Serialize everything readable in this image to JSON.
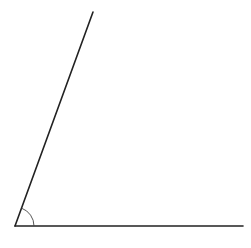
{
  "diagram": {
    "type": "angle",
    "vertex": {
      "x": 15,
      "y": 226
    },
    "ray_slanted_end": {
      "x": 93,
      "y": 12
    },
    "ray_horizontal_end": {
      "x": 243,
      "y": 226
    },
    "arc_radius": 19,
    "stroke_color": "#222222",
    "arc_color": "#444444",
    "background": "#ffffff"
  }
}
